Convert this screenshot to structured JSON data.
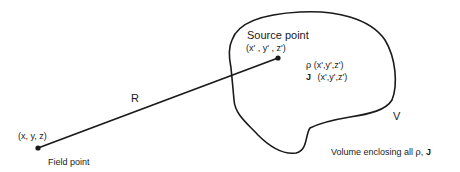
{
  "diagram": {
    "field_point": {
      "coords_label": "(x, y, z)",
      "name_label": "Field point"
    },
    "source_point": {
      "name_label": "Source point",
      "coords_label": "(x' , y' , z')"
    },
    "separation": {
      "label": "R"
    },
    "distributions": {
      "rho_symbol": "ρ",
      "rho_args": "(x',y',z')",
      "j_symbol": "J",
      "j_args": "(x',y',z')"
    },
    "volume": {
      "label": "V",
      "caption_prefix": "Volume enclosing all ",
      "caption_rho": "ρ",
      "caption_sep": ", ",
      "caption_j": "J"
    },
    "colors": {
      "ink": "#1a1a1a",
      "background": "#ffffff"
    }
  }
}
